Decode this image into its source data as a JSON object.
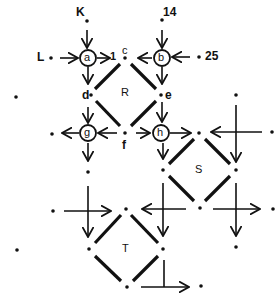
{
  "diagram": {
    "type": "network-flow-diagram",
    "regions": [
      {
        "id": "R",
        "label": "R"
      },
      {
        "id": "S",
        "label": "S"
      },
      {
        "id": "T",
        "label": "T"
      }
    ],
    "circled_nodes": [
      {
        "id": "a",
        "label": "a"
      },
      {
        "id": "b",
        "label": "b"
      },
      {
        "id": "g",
        "label": "g"
      },
      {
        "id": "h",
        "label": "h"
      }
    ],
    "point_labels": {
      "K": "K",
      "L": "L",
      "c": "c",
      "d": "d",
      "e": "e",
      "f": "f",
      "one": "1",
      "fourteen": "14",
      "twentyfive": "25"
    },
    "colors": {
      "ink": "#111111",
      "background": "#ffffff"
    }
  }
}
